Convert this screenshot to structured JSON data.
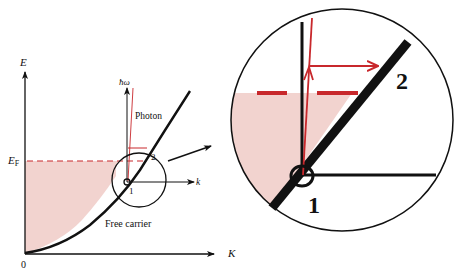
{
  "colors": {
    "ink": "#111111",
    "photon_red": "#c8282c",
    "fermi_dash": "#c8282c",
    "filled_states": "#f2d3cf"
  },
  "left_panel": {
    "y_axis_label": "E",
    "x_axis_label": "K",
    "origin_label": "0",
    "fermi_label": "E",
    "fermi_subscript": "F",
    "photon_axis_label": "ħω",
    "photon_label": "Photon",
    "k_axis_label": "k",
    "point_1_label": "1",
    "point_2_label": "2",
    "curve_label": "Free carrier"
  },
  "right_panel": {
    "point_1_label": "1",
    "point_2_label": "2"
  }
}
